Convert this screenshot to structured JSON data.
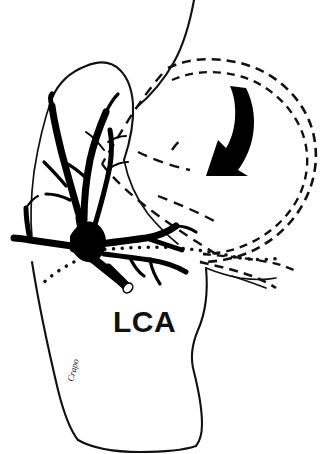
{
  "figure": {
    "background_color": "#ffffff",
    "ink_color": "#111111",
    "width": 333,
    "height": 454,
    "labels": {
      "artery_label": "LCA",
      "artist_signature": "Crapo"
    },
    "annotations": {
      "arrow_name": "retraction-direction-arrow",
      "arrow_meaning": "direction of stomach retraction",
      "ghost_outline_meaning": "original (pre-retraction) position of stomach shown dashed",
      "dotted_line_meaning": "peritoneal / lesser omentum incision line"
    },
    "elements": [
      {
        "name": "stomach-body-outline",
        "style": "solid",
        "description": "solid ink contour of retracted stomach and cardia"
      },
      {
        "name": "esophagus-outline",
        "style": "solid",
        "description": "esophagus running off the top of the frame"
      },
      {
        "name": "ghost-stomach-outline",
        "style": "dashed",
        "description": "double dashed loop marking the displaced stomach position"
      },
      {
        "name": "lca-arterial-tree",
        "style": "solid-filled",
        "description": "thick black left gastric artery trunk with ascending branches"
      },
      {
        "name": "cut-vessel-end",
        "style": "open-lumen",
        "description": "transected artery showing open lumen"
      },
      {
        "name": "incision-dotted-line",
        "style": "dotted",
        "description": "dotted guide line across the lesser curvature"
      },
      {
        "name": "retraction-arrow",
        "style": "solid-filled",
        "description": "thick curved arrow pointing down and to the left"
      }
    ]
  }
}
